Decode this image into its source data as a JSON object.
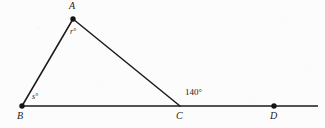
{
  "figure": {
    "kind": "geometry-diagram",
    "background_color": "#fcfcfc",
    "stroke_color": "#1b1b1b",
    "canvas": {
      "width": 325,
      "height": 128
    },
    "points": [
      {
        "id": "A",
        "label": "A",
        "x": 73,
        "y": 19,
        "dot": true,
        "label_x": 70,
        "label_y": 2
      },
      {
        "id": "B",
        "label": "B",
        "x": 22,
        "y": 106,
        "dot": true,
        "label_x": 18,
        "label_y": 111
      },
      {
        "id": "C",
        "label": "C",
        "x": 180,
        "y": 106,
        "dot": false,
        "label_x": 177,
        "label_y": 111
      },
      {
        "id": "D",
        "label": "D",
        "x": 274,
        "y": 106,
        "dot": true,
        "label_x": 270,
        "label_y": 111
      }
    ],
    "segments": [
      {
        "id": "AB",
        "from": "A",
        "to": "B"
      },
      {
        "id": "AC",
        "from": "A",
        "to": "C"
      },
      {
        "id": "BD_line",
        "from_x": 22,
        "from_y": 106,
        "to_x": 318,
        "to_y": 106
      }
    ],
    "angle_labels": [
      {
        "id": "angle-A",
        "text": "r°",
        "x": 71,
        "y": 30,
        "italic": true,
        "size": "small"
      },
      {
        "id": "angle-B",
        "text": "s°",
        "x": 32,
        "y": 94,
        "italic": true,
        "size": "small"
      },
      {
        "id": "angle-C",
        "text": "140°",
        "x": 184,
        "y": 89,
        "italic": false,
        "size": "num"
      }
    ]
  }
}
